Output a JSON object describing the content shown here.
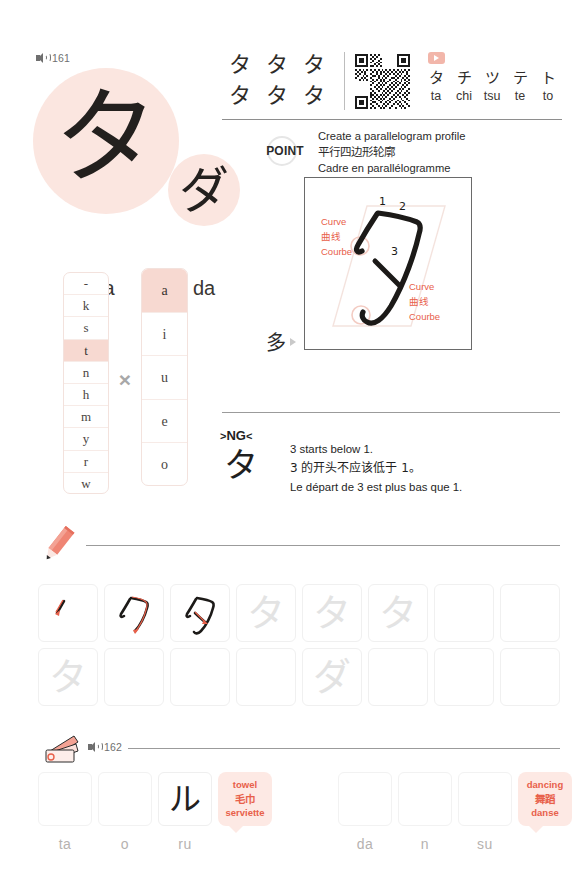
{
  "hero": {
    "audio_label": "161",
    "main_kana": "タ",
    "main_romaji": "ta",
    "voiced_kana": "ダ",
    "voiced_romaji": "da"
  },
  "header": {
    "kana_samples": [
      "タ",
      "タ",
      "タ",
      "タ",
      "タ",
      "タ"
    ],
    "qr_alt": "qr-code",
    "play_alt": "play-button",
    "row": [
      {
        "kana": "タ",
        "romaji": "ta"
      },
      {
        "kana": "チ",
        "romaji": "chi"
      },
      {
        "kana": "ツ",
        "romaji": "tsu"
      },
      {
        "kana": "テ",
        "romaji": "te"
      },
      {
        "kana": "ト",
        "romaji": "to"
      }
    ]
  },
  "point": {
    "badge": "POINT",
    "en": "Create a parallelogram profile",
    "zh": "平行四边形轮廓",
    "fr": "Cadre en parallélogramme"
  },
  "diagram": {
    "character": "タ",
    "stroke_numbers": [
      "1",
      "2",
      "3"
    ],
    "annotation_top": {
      "en": "Curve",
      "zh": "曲线",
      "fr": "Courbe"
    },
    "annotation_bottom": {
      "en": "Curve",
      "zh": "曲线",
      "fr": "Courbe"
    },
    "kanji_origin": "多"
  },
  "ng": {
    "tag": "NG",
    "glyph": "タ",
    "en": "3 starts below 1.",
    "zh": "3 的开头不应该低于 1。",
    "fr": "Le départ de 3 est plus bas que 1."
  },
  "syllable_table": {
    "consonants": [
      "-",
      "k",
      "s",
      "t",
      "n",
      "h",
      "m",
      "y",
      "r",
      "w"
    ],
    "consonant_selected": "t",
    "vowels": [
      "a",
      "i",
      "u",
      "e",
      "o"
    ],
    "vowel_selected": "a",
    "operator": "×"
  },
  "practice": {
    "pencil_alt": "pencil-icon",
    "row1": [
      {
        "type": "stroke1"
      },
      {
        "type": "stroke2"
      },
      {
        "type": "stroke3"
      },
      {
        "type": "trace",
        "char": "タ"
      },
      {
        "type": "trace",
        "char": "タ"
      },
      {
        "type": "trace",
        "char": "タ"
      },
      {
        "type": "empty"
      },
      {
        "type": "empty"
      }
    ],
    "row2": [
      {
        "type": "trace",
        "char": "タ"
      },
      {
        "type": "empty"
      },
      {
        "type": "empty"
      },
      {
        "type": "empty"
      },
      {
        "type": "trace",
        "char": "ダ"
      },
      {
        "type": "empty"
      },
      {
        "type": "empty"
      },
      {
        "type": "empty"
      }
    ]
  },
  "words": {
    "cards_alt": "flashcards-icon",
    "audio_label": "162",
    "cells": [
      {
        "kana": "",
        "romaji": "ta",
        "box": true
      },
      {
        "kana": "",
        "romaji": "o",
        "box": true
      },
      {
        "kana": "ル",
        "romaji": "ru",
        "box": true
      },
      {
        "bubble": {
          "en": "towel",
          "zh": "毛巾",
          "fr": "serviette"
        }
      },
      {
        "kana": "",
        "romaji": "",
        "box": false
      },
      {
        "kana": "",
        "romaji": "da",
        "box": true
      },
      {
        "kana": "",
        "romaji": "n",
        "box": true
      },
      {
        "kana": "",
        "romaji": "su",
        "box": true
      },
      {
        "bubble": {
          "en": "dancing",
          "zh": "舞蹈",
          "fr": "danse"
        }
      }
    ]
  },
  "colors": {
    "pink_blob": "#fbe6e0",
    "accent_red": "#e8604a",
    "highlight": "#f7d9d1",
    "ink": "#23201e"
  }
}
